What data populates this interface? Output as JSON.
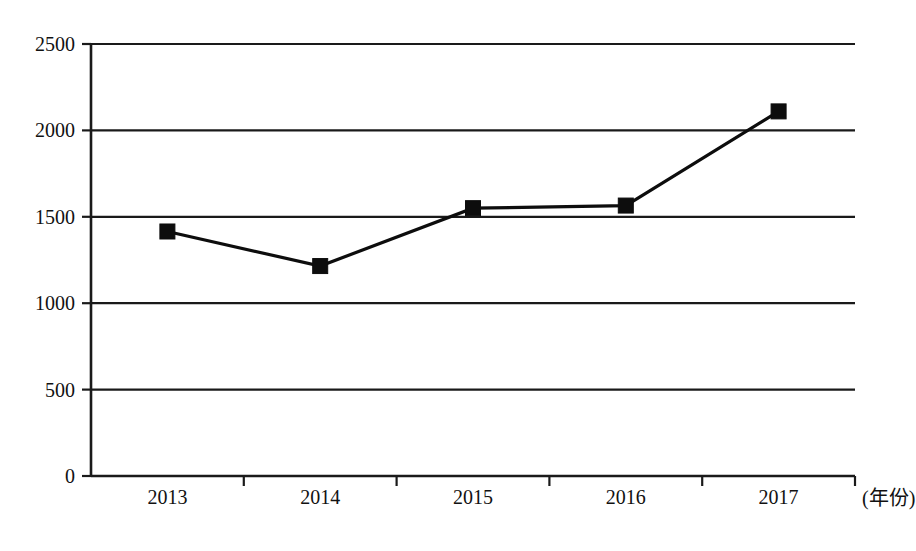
{
  "chart_data": {
    "type": "line",
    "title": "",
    "subtitle": "",
    "xlabel": "(年份)",
    "ylabel": "",
    "categories": [
      "2013",
      "2014",
      "2015",
      "2016",
      "2017"
    ],
    "values": [
      1415,
      1215,
      1550,
      1565,
      2110
    ],
    "series": [
      {
        "name": "",
        "values": [
          1415,
          1215,
          1550,
          1565,
          2110
        ]
      }
    ],
    "ylim": [
      0,
      2500
    ],
    "ytick_labels": [
      "0",
      "500",
      "1000",
      "1500",
      "2000",
      "2500"
    ],
    "ytick_values": [
      0,
      500,
      1000,
      1500,
      2000,
      2500
    ],
    "xtick_labels": [
      "2013",
      "2014",
      "2015",
      "2016",
      "2017"
    ],
    "grid": true,
    "grid_axis": "y",
    "legend": false,
    "legend_position": "none",
    "marker": "square",
    "line_color": "#0d0d0d",
    "marker_color": "#0d0d0d",
    "grid_color": "#1a1a1a",
    "background_color": "#ffffff",
    "annotations": []
  },
  "axes": {
    "y_axis_name": "y-axis",
    "x_axis_name": "x-axis",
    "x_caption": "(年份)"
  }
}
